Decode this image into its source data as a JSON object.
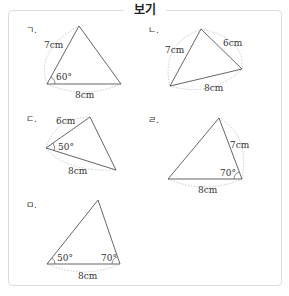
{
  "title": "보기",
  "items": [
    {
      "marker": "ㄱ.",
      "labels": {
        "side_a": "7cm",
        "angle": "60°",
        "base": "8cm"
      },
      "given": {
        "sides": [
          "7cm",
          "8cm"
        ],
        "angle": "60°"
      }
    },
    {
      "marker": "ㄴ.",
      "labels": {
        "side_a": "6cm",
        "side_b": "7cm",
        "base": "8cm"
      },
      "given": {
        "sides": [
          "6cm",
          "7cm",
          "8cm"
        ]
      }
    },
    {
      "marker": "ㄷ.",
      "labels": {
        "side_a": "6cm",
        "angle": "50°",
        "base": "8cm"
      },
      "given": {
        "sides": [
          "6cm",
          "8cm"
        ],
        "angle": "50°"
      }
    },
    {
      "marker": "ㄹ.",
      "labels": {
        "side_a": "7cm",
        "angle": "70°",
        "base": "8cm"
      },
      "given": {
        "sides": [
          "7cm",
          "8cm"
        ],
        "angle": "70°"
      }
    },
    {
      "marker": "ㅁ.",
      "labels": {
        "angle_a": "50°",
        "angle_b": "70°",
        "base": "8cm"
      },
      "given": {
        "sides": [
          "8cm"
        ],
        "angles": [
          "50°",
          "70°"
        ]
      }
    }
  ],
  "colors": {
    "line": "#555555",
    "dotted_arc": "#bbbbbb",
    "border": "#dcdcdc"
  }
}
